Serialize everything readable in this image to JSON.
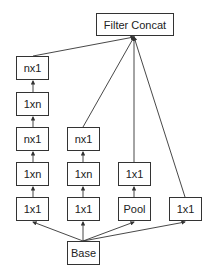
{
  "diagram": {
    "type": "inception-module",
    "nodes": {
      "concat": {
        "label": "Filter Concat",
        "x": 96,
        "y": 13,
        "w": 78,
        "h": 23
      },
      "c1_nx1_top": {
        "label": "nx1",
        "x": 16,
        "y": 56,
        "w": 33,
        "h": 24
      },
      "c1_1xn_top": {
        "label": "1xn",
        "x": 16,
        "y": 92,
        "w": 33,
        "h": 24
      },
      "c1_nx1_mid": {
        "label": "nx1",
        "x": 16,
        "y": 127,
        "w": 33,
        "h": 24
      },
      "c1_1xn_bot": {
        "label": "1xn",
        "x": 16,
        "y": 162,
        "w": 33,
        "h": 24
      },
      "c1_1x1": {
        "label": "1x1",
        "x": 16,
        "y": 197,
        "w": 33,
        "h": 24
      },
      "c2_nx1": {
        "label": "nx1",
        "x": 67,
        "y": 127,
        "w": 33,
        "h": 24
      },
      "c2_1xn": {
        "label": "1xn",
        "x": 67,
        "y": 162,
        "w": 33,
        "h": 24
      },
      "c2_1x1": {
        "label": "1x1",
        "x": 67,
        "y": 197,
        "w": 33,
        "h": 24
      },
      "c3_1x1": {
        "label": "1x1",
        "x": 118,
        "y": 162,
        "w": 33,
        "h": 24
      },
      "c3_pool": {
        "label": "Pool",
        "x": 118,
        "y": 197,
        "w": 33,
        "h": 24
      },
      "c4_1x1": {
        "label": "1x1",
        "x": 169,
        "y": 197,
        "w": 33,
        "h": 24
      },
      "base": {
        "label": "Base",
        "x": 67,
        "y": 241,
        "w": 33,
        "h": 24
      }
    },
    "edges": [
      [
        "base",
        "c1_1x1"
      ],
      [
        "base",
        "c2_1x1"
      ],
      [
        "base",
        "c3_pool"
      ],
      [
        "base",
        "c4_1x1"
      ],
      [
        "c1_1x1",
        "c1_1xn_bot"
      ],
      [
        "c1_1xn_bot",
        "c1_nx1_mid"
      ],
      [
        "c1_nx1_mid",
        "c1_1xn_top"
      ],
      [
        "c1_1xn_top",
        "c1_nx1_top"
      ],
      [
        "c2_1x1",
        "c2_1xn"
      ],
      [
        "c2_1xn",
        "c2_nx1"
      ],
      [
        "c3_pool",
        "c3_1x1"
      ],
      [
        "c1_nx1_top",
        "concat"
      ],
      [
        "c2_nx1",
        "concat"
      ],
      [
        "c3_1x1",
        "concat"
      ],
      [
        "c4_1x1",
        "concat"
      ]
    ],
    "colors": {
      "stroke": "#333333",
      "fill": "#ffffff",
      "text": "#222222"
    }
  }
}
